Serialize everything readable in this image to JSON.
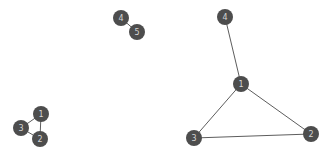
{
  "diagram": {
    "type": "node-link-graph",
    "title": "",
    "background_color": "#ffffff",
    "node_fill_color": "#4d4d4d",
    "node_label_color": "#d5d5d5",
    "edge_color": "#5d5d5d",
    "node_radius": 8,
    "edge_width": 1,
    "components": [
      {
        "name": "component-left",
        "nodes": [
          {
            "id": "left-1",
            "label": "1",
            "x": 41,
            "y": 114
          },
          {
            "id": "left-2",
            "label": "2",
            "x": 40,
            "y": 139
          },
          {
            "id": "left-3",
            "label": "3",
            "x": 21,
            "y": 128
          }
        ],
        "edges": [
          {
            "source": "left-3",
            "target": "left-1"
          },
          {
            "source": "left-3",
            "target": "left-2"
          },
          {
            "source": "left-1",
            "target": "left-2"
          }
        ]
      },
      {
        "name": "component-middle",
        "nodes": [
          {
            "id": "mid-4",
            "label": "4",
            "x": 121,
            "y": 18
          },
          {
            "id": "mid-5",
            "label": "5",
            "x": 137,
            "y": 32
          }
        ],
        "edges": [
          {
            "source": "mid-4",
            "target": "mid-5"
          }
        ]
      },
      {
        "name": "component-right",
        "nodes": [
          {
            "id": "right-4",
            "label": "4",
            "x": 225,
            "y": 17
          },
          {
            "id": "right-1",
            "label": "1",
            "x": 241,
            "y": 84
          },
          {
            "id": "right-3",
            "label": "3",
            "x": 194,
            "y": 138
          },
          {
            "id": "right-2",
            "label": "2",
            "x": 311,
            "y": 134
          }
        ],
        "edges": [
          {
            "source": "right-4",
            "target": "right-1"
          },
          {
            "source": "right-1",
            "target": "right-3"
          },
          {
            "source": "right-1",
            "target": "right-2"
          },
          {
            "source": "right-3",
            "target": "right-2"
          }
        ]
      }
    ]
  }
}
